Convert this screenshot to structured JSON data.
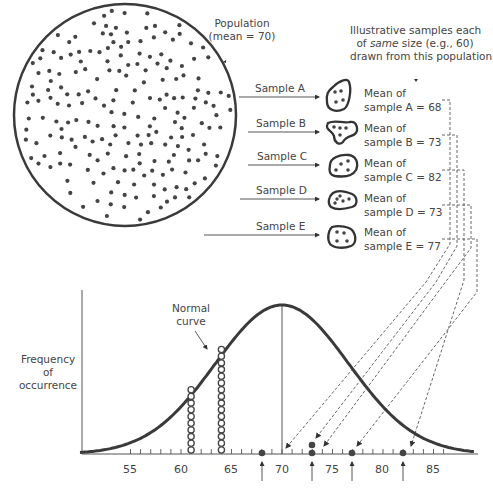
{
  "population": {
    "label_line1": "Population",
    "label_line2": "(mean = 70)",
    "mean": 70
  },
  "samples_note": {
    "line1": "Illustrative samples each",
    "line2_pre": "of ",
    "line2_em": "same",
    "line2_post": " size (e.g., 60)",
    "line3": "drawn from this population"
  },
  "samples": [
    {
      "name": "Sample A",
      "mean_line1": "Mean of",
      "mean_line2": "sample A = 68",
      "mean": 68
    },
    {
      "name": "Sample B",
      "mean_line1": "Mean of",
      "mean_line2": "sample B = 73",
      "mean": 73
    },
    {
      "name": "Sample C",
      "mean_line1": "Mean of",
      "mean_line2": "sample C = 82",
      "mean": 82
    },
    {
      "name": "Sample D",
      "mean_line1": "Mean of",
      "mean_line2": "sample D = 73",
      "mean": 73
    },
    {
      "name": "Sample E",
      "mean_line1": "Mean of",
      "mean_line2": "sample E = 77",
      "mean": 77
    }
  ],
  "chart": {
    "curve_label_line1": "Normal",
    "curve_label_line2": "curve",
    "ylabel_line1": "Frequency",
    "ylabel_line2": "of",
    "ylabel_line3": "occurrence",
    "x_ticks": [
      "55",
      "60",
      "65",
      "70",
      "75",
      "80",
      "85"
    ]
  },
  "chart_data": {
    "type": "scatter",
    "title": "",
    "xlabel": "",
    "ylabel": "Frequency of occurrence",
    "x_tick_labels": [
      55,
      60,
      65,
      70,
      75,
      80,
      85
    ],
    "xlim": [
      50,
      89
    ],
    "population_mean": 70,
    "curve": "normal",
    "sample_means": [
      68,
      73,
      82,
      73,
      77
    ],
    "plotted_points": [
      {
        "x": 68,
        "count": 1
      },
      {
        "x": 73,
        "count": 2
      },
      {
        "x": 77,
        "count": 1
      },
      {
        "x": 82,
        "count": 1
      }
    ],
    "stacked_columns": [
      {
        "x": 61,
        "count": 10
      },
      {
        "x": 64,
        "count": 16
      }
    ],
    "annotations": [
      "Normal curve"
    ],
    "grid": false
  }
}
